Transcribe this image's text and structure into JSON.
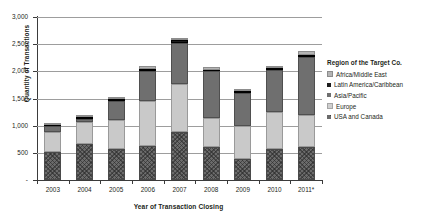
{
  "chart_data": {
    "type": "bar",
    "subtype": "stacked-column",
    "title": "",
    "xlabel": "Year of Transaction Closing",
    "ylabel": "Quantity of Transactions",
    "categories": [
      "2003",
      "2004",
      "2005",
      "2006",
      "2007",
      "2008",
      "2009",
      "2010",
      "2011*"
    ],
    "ylim": [
      0,
      3000
    ],
    "ytick_labels": [
      "-",
      "500",
      "1,000",
      "1,500",
      "2,000",
      "2,500",
      "3,000"
    ],
    "ytick_values": [
      0,
      500,
      1000,
      1500,
      2000,
      2500,
      3000
    ],
    "grid": "horizontal",
    "legend_position": "right",
    "legend_title": "Region of the Target Co.",
    "stack_order_bottom_to_top": [
      "USA and Canada",
      "Europe",
      "Asia/Pacific",
      "Latin America/Caribbean",
      "Africa/Middle East"
    ],
    "series": [
      {
        "name": "USA and Canada",
        "color": "#6b6b6b",
        "pattern": "crosshatch",
        "values": [
          520,
          660,
          570,
          620,
          880,
          600,
          380,
          580,
          600
        ]
      },
      {
        "name": "Europe",
        "color": "#c9c9c9",
        "pattern": "solid",
        "values": [
          370,
          400,
          530,
          830,
          880,
          540,
          620,
          680,
          590
        ]
      },
      {
        "name": "Asia/Pacific",
        "color": "#6f6f6f",
        "pattern": "solid",
        "values": [
          110,
          70,
          350,
          560,
          760,
          860,
          600,
          760,
          1080
        ]
      },
      {
        "name": "Latin America/Caribbean",
        "color": "#1c1c1c",
        "pattern": "solid",
        "values": [
          20,
          30,
          40,
          40,
          60,
          30,
          30,
          40,
          40
        ]
      },
      {
        "name": "Africa/Middle East",
        "color": "#b4b4b4",
        "pattern": "solid",
        "values": [
          20,
          20,
          40,
          40,
          40,
          50,
          30,
          40,
          60
        ]
      }
    ],
    "totals": [
      1040,
      1180,
      1530,
      2090,
      2620,
      2080,
      1660,
      2100,
      2370
    ]
  },
  "legend": {
    "title": "Region of the Target Co.",
    "items": [
      {
        "label": "Africa/Middle East",
        "swatch": "sw-africa"
      },
      {
        "label": "Latin America/Caribbean",
        "swatch": "sw-latam"
      },
      {
        "label": "Asia/Pacific",
        "swatch": "sw-asia"
      },
      {
        "label": "Europe",
        "swatch": "sw-europe"
      },
      {
        "label": "USA and Canada",
        "swatch": "sw-usa"
      }
    ]
  }
}
